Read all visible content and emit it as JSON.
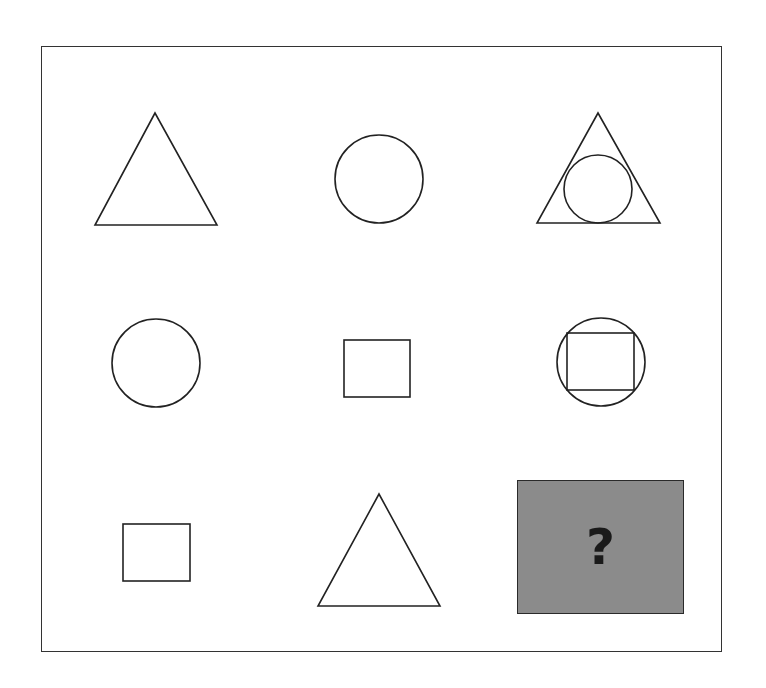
{
  "puzzle": {
    "type": "matrix-reasoning-3x3",
    "stroke_color": "#222222",
    "cells": [
      {
        "row": 1,
        "col": 1,
        "shape": "triangle"
      },
      {
        "row": 1,
        "col": 2,
        "shape": "circle"
      },
      {
        "row": 1,
        "col": 3,
        "shape": "circle-inside-triangle"
      },
      {
        "row": 2,
        "col": 1,
        "shape": "circle"
      },
      {
        "row": 2,
        "col": 2,
        "shape": "square"
      },
      {
        "row": 2,
        "col": 3,
        "shape": "square-inside-circle"
      },
      {
        "row": 3,
        "col": 1,
        "shape": "square"
      },
      {
        "row": 3,
        "col": 2,
        "shape": "triangle"
      },
      {
        "row": 3,
        "col": 3,
        "shape": "unknown"
      }
    ],
    "answer_box": {
      "label": "?",
      "fill_color": "#8b8b8b"
    }
  }
}
